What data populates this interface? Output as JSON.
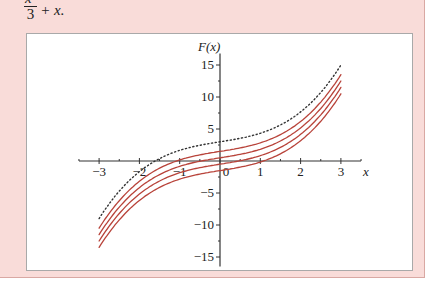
{
  "header": {
    "formula_numerator": "x³",
    "formula_denominator": "3",
    "formula_rest": "+ x."
  },
  "colors": {
    "panel_bg": "#f9dcd9",
    "curve_red": "#b8433a",
    "dotted": "#333333",
    "axis": "#333333"
  },
  "chart_data": {
    "type": "line",
    "title": "",
    "function": "F(x) = x^3/3 + x + C",
    "xlabel": "x",
    "ylabel": "F(x)",
    "xlim": [
      -3.5,
      3.5
    ],
    "ylim": [
      -16.5,
      17
    ],
    "x_ticks": [
      -3,
      -2,
      -1,
      0,
      1,
      2,
      3
    ],
    "x_tick_labels": [
      "−3",
      "−2",
      "−1",
      "0",
      "1",
      "2",
      "3"
    ],
    "y_ticks": [
      -15,
      -10,
      -5,
      5,
      10,
      15
    ],
    "y_tick_labels": [
      "−15",
      "−10",
      "−5",
      "5",
      "10",
      "15"
    ],
    "grid": false,
    "legend": null,
    "x_domain": [
      -3,
      3
    ],
    "series": [
      {
        "name": "C = 3",
        "style": "dotted",
        "C": 3
      },
      {
        "name": "C = 1.5",
        "style": "solid-red",
        "C": 1.5
      },
      {
        "name": "C = 0.5",
        "style": "solid-red",
        "C": 0.5
      },
      {
        "name": "C = -0.5",
        "style": "solid-red",
        "C": -0.5
      },
      {
        "name": "C = -1.5",
        "style": "solid-red",
        "C": -1.5
      }
    ]
  }
}
